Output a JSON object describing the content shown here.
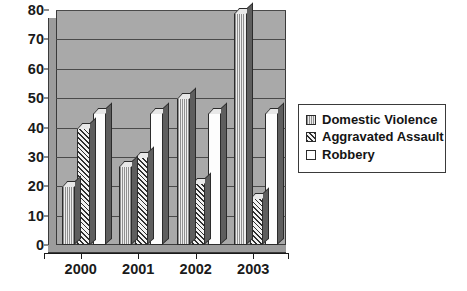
{
  "chart_data": {
    "type": "bar",
    "title": "",
    "subtitle": "",
    "xlabel": "",
    "ylabel": "",
    "categories": [
      "2000",
      "2001",
      "2002",
      "2003"
    ],
    "series": [
      {
        "name": "Domestic Violence",
        "pattern": "vertical-lines",
        "values": [
          20,
          27,
          50,
          79
        ]
      },
      {
        "name": "Aggravated Assault",
        "pattern": "diagonal-hatch",
        "values": [
          40,
          30,
          21,
          16
        ]
      },
      {
        "name": "Robbery",
        "pattern": "solid-white",
        "values": [
          45,
          45,
          45,
          45
        ]
      }
    ],
    "ylim": [
      0,
      80
    ],
    "yticks": [
      0,
      10,
      20,
      30,
      40,
      50,
      60,
      70,
      80
    ],
    "ytick_labels": [
      "0",
      "10",
      "20",
      "30",
      "40",
      "50",
      "60",
      "70",
      "80"
    ],
    "grid": true,
    "grid_axis": "y",
    "legend_position": "right",
    "style_3d": true,
    "colors": {
      "plot_background": "#a9a9a9",
      "gridline": "#4a4a4a",
      "axis": "#1a1a1a",
      "bar_outline": "#2b2b2b",
      "bar_shadow": "#5e5e5e",
      "domestic_violence_fill": "#e6e6e6",
      "aggravated_assault_fill": "#ededed",
      "robbery_fill": "#fdfdfd",
      "legend_border": "#3a3a3a",
      "page_background": "#ffffff"
    }
  },
  "legend": {
    "items": [
      {
        "label": "Domestic Violence",
        "swatch": "legend-swatch-domestic-violence"
      },
      {
        "label": "Aggravated Assault",
        "swatch": "legend-swatch-aggravated-assault"
      },
      {
        "label": "Robbery",
        "swatch": "legend-swatch-robbery"
      }
    ]
  }
}
